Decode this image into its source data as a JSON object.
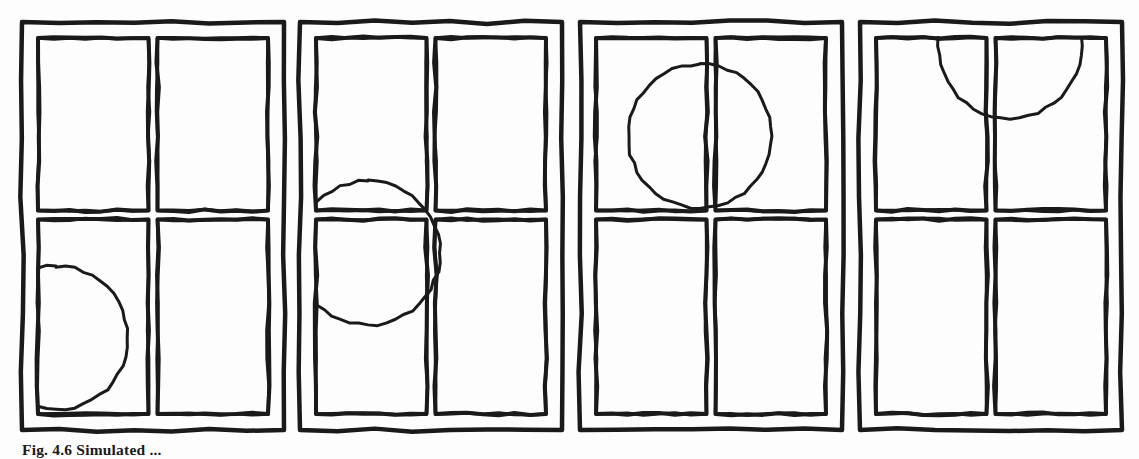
{
  "document": {
    "kind": "scanned-book-figure",
    "background_color": "#fdfdfd",
    "ink_color": "#1a1a1a"
  },
  "caption": {
    "label": "Fig. 4.6",
    "text": "Simulated ...",
    "full": "Fig. 4.6  Simulated ..."
  },
  "figure": {
    "panel_count": 4,
    "panel_description": "Four hand-drawn rectangular window frames, each divided into a two-by-two grid of panes, with a circle drawn in a progressively different position in each frame.",
    "panels": [
      {
        "index": 1,
        "name": "panel-1",
        "x": 22,
        "y": 22,
        "width": 262,
        "height": 408,
        "circle": {
          "name": "circle-lower-left",
          "cx": 18,
          "cy": 300,
          "r": 72,
          "position_label": "lower-left pane, clipped by left frame edge"
        }
      },
      {
        "index": 2,
        "name": "panel-2",
        "x": 300,
        "y": 22,
        "width": 262,
        "height": 408,
        "circle": {
          "name": "circle-mid-left",
          "cx": 52,
          "cy": 215,
          "r": 72,
          "position_label": "straddling horizontal divider at left, clipped by left frame edge"
        }
      },
      {
        "index": 3,
        "name": "panel-3",
        "x": 580,
        "y": 22,
        "width": 262,
        "height": 408,
        "circle": {
          "name": "circle-upper-left",
          "cx": 104,
          "cy": 98,
          "r": 72,
          "position_label": "upper-left pane, fully inside, touching vertical divider"
        }
      },
      {
        "index": 4,
        "name": "panel-4",
        "x": 860,
        "y": 22,
        "width": 262,
        "height": 408,
        "circle": {
          "name": "circle-top-center",
          "cx": 134,
          "cy": 8,
          "r": 72,
          "position_label": "top centre, straddling vertical divider, clipped by top frame edge"
        }
      }
    ],
    "frame": {
      "outer_stroke": 4.5,
      "inner_stroke": 4.0,
      "circle_stroke": 3.0,
      "mullion_gap": 16,
      "divider_y_fraction": 0.47
    }
  }
}
